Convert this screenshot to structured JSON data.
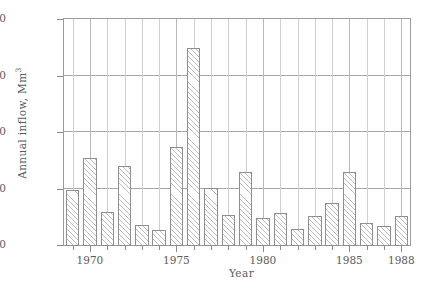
{
  "chart_data": {
    "type": "bar",
    "title": "",
    "xlabel": "Year",
    "ylabel": "Annual inflow, Mm3",
    "ylabel_base": "Annual inflow, Mm",
    "ylabel_exponent": "3",
    "categories": [
      1969,
      1970,
      1971,
      1972,
      1973,
      1974,
      1975,
      1976,
      1977,
      1978,
      1979,
      1980,
      1981,
      1982,
      1983,
      1984,
      1985,
      1986,
      1987,
      1988
    ],
    "values": [
      197,
      310,
      122,
      285,
      75,
      55,
      352,
      700,
      205,
      110,
      263,
      100,
      118,
      60,
      108,
      152,
      262,
      80,
      72,
      105
    ],
    "ylim": [
      0,
      800
    ],
    "yticks": [
      0,
      200,
      400,
      600,
      800
    ],
    "ytick_labels": [
      "0",
      "200",
      "400",
      "600",
      "800"
    ],
    "xlim": [
      1968.5,
      1988.5
    ],
    "xtick_labels": [
      "1970",
      "1975",
      "1980",
      "1985",
      "1988"
    ],
    "xtick_values": [
      1970,
      1975,
      1980,
      1985,
      1988
    ],
    "grid": "both",
    "legend": "none",
    "bar_fill": "hatch-45",
    "bar_edge_color": "#8f8f8f",
    "hatch_color": "#bdbdbd",
    "background": "#ffffff",
    "frame_color": "#9a9a9a"
  }
}
